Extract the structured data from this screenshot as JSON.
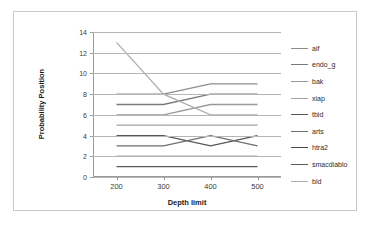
{
  "chart_data": {
    "type": "line",
    "title": "",
    "xlabel": "Depth limit",
    "ylabel": "Probability Position",
    "x": [
      200,
      300,
      400,
      500
    ],
    "categories": [
      "200",
      "300",
      "400",
      "500"
    ],
    "xlim": [
      150,
      550
    ],
    "ylim": [
      0,
      14
    ],
    "ytick_values": [
      0,
      2,
      4,
      6,
      8,
      10,
      12,
      14
    ],
    "ytick_labels": [
      "0",
      "2",
      "4",
      "6",
      "8",
      "10",
      "12",
      "14"
    ],
    "xtick_labels": [
      "200",
      "300",
      "400",
      "500"
    ],
    "grid": "horizontal",
    "legend_position": "right",
    "series": [
      {
        "name": "aif",
        "values": [
          8,
          8,
          9,
          9
        ],
        "color": "#8c8c8c"
      },
      {
        "name": "endo_g",
        "values": [
          7,
          7,
          8,
          8
        ],
        "color": "#7a7a7a"
      },
      {
        "name": "bak",
        "values": [
          6,
          6,
          7,
          7
        ],
        "color": "#999999"
      },
      {
        "name": "xiap",
        "values": [
          5,
          5,
          5,
          5
        ],
        "color": "#a0a0a0"
      },
      {
        "name": "tbid",
        "values": [
          4,
          4,
          3,
          4
        ],
        "color": "#555555"
      },
      {
        "name": "arts",
        "values": [
          3,
          3,
          4,
          3
        ],
        "color": "#6e6e6e"
      },
      {
        "name": "htra2",
        "values": [
          2,
          2,
          2,
          2
        ],
        "color": "#4a4a4a"
      },
      {
        "name": "smacdiablo",
        "values": [
          1,
          1,
          1,
          1
        ],
        "color": "#5a5a5a"
      },
      {
        "name": "bid",
        "values": [
          13,
          8,
          6,
          6
        ],
        "color": "#aeaeae"
      }
    ]
  },
  "legend": {
    "items": [
      {
        "label": "aif"
      },
      {
        "label": "endo_g"
      },
      {
        "label": "bak"
      },
      {
        "label": "xiap"
      },
      {
        "label": "tbid"
      },
      {
        "label": "arts"
      },
      {
        "label": "htra2"
      },
      {
        "label": "smacdiablo"
      },
      {
        "label": "bid"
      }
    ]
  }
}
